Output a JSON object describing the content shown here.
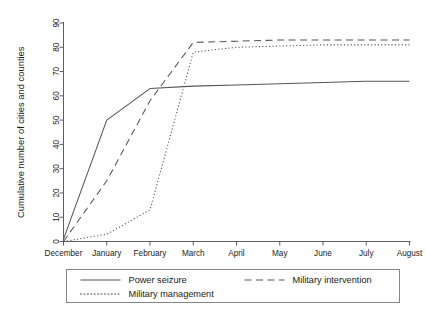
{
  "chart_data": {
    "type": "line",
    "title": "",
    "xlabel": "",
    "ylabel": "Cumulative number of cities and counties",
    "x": [
      "December",
      "January",
      "February",
      "March",
      "April",
      "May",
      "June",
      "July",
      "August"
    ],
    "categories": [
      "December",
      "January",
      "February",
      "March",
      "April",
      "May",
      "June",
      "July",
      "August"
    ],
    "xtick_labels": [
      "December",
      "January",
      "February",
      "March",
      "April",
      "May",
      "June",
      "July",
      "August"
    ],
    "ytick_labels": [
      "0",
      "10",
      "20",
      "30",
      "40",
      "50",
      "60",
      "70",
      "80",
      "90"
    ],
    "ytick_values": [
      0,
      10,
      20,
      30,
      40,
      50,
      60,
      70,
      80,
      90
    ],
    "ylim": [
      0,
      90
    ],
    "xlim": [
      0,
      8
    ],
    "grid": false,
    "legend_position": "bottom",
    "series": [
      {
        "name": "Power seizure",
        "style": "solid",
        "values": [
          1,
          50,
          63,
          64,
          64.5,
          65,
          65.5,
          66,
          66
        ]
      },
      {
        "name": "Military intervention",
        "style": "dashed",
        "values": [
          0,
          25,
          58,
          82,
          82.5,
          83,
          83,
          83,
          83
        ]
      },
      {
        "name": "Military management",
        "style": "dotted",
        "values": [
          0,
          3,
          13,
          78,
          80,
          80.5,
          81,
          81,
          81
        ]
      }
    ]
  },
  "legend": {
    "entries": [
      {
        "label": "Power seizure",
        "style": "solid"
      },
      {
        "label": "Military intervention",
        "style": "dashed"
      },
      {
        "label": "Military management",
        "style": "dotted"
      }
    ]
  },
  "colors": {
    "line": "#555555",
    "axis": "#4d4d4d",
    "text": "#1a1a1a",
    "background": "#ffffff",
    "legend_border": "#7a7a7a"
  }
}
